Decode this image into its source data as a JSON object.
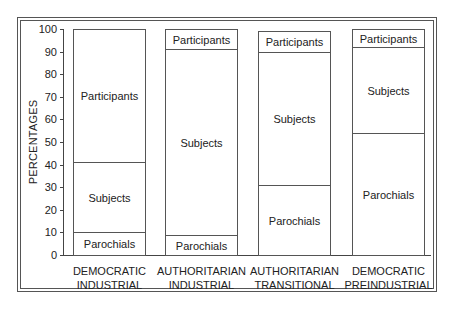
{
  "chart_data": {
    "type": "bar",
    "stacked": true,
    "title": "",
    "xlabel": "",
    "ylabel": "PERCENTAGES",
    "ylim": [
      0,
      100
    ],
    "yticks": [
      0,
      10,
      20,
      30,
      40,
      50,
      60,
      70,
      80,
      90,
      100
    ],
    "categories": [
      [
        "DEMOCRATIC",
        "INDUSTRIAL"
      ],
      [
        "AUTHORITARIAN",
        "INDUSTRIAL"
      ],
      [
        "AUTHORITARIAN",
        "TRANSITIONAL"
      ],
      [
        "DEMOCRATIC",
        "PREINDUSTRIAL"
      ]
    ],
    "series": [
      {
        "name": "Parochials",
        "values": [
          10,
          9,
          31,
          54
        ]
      },
      {
        "name": "Subjects",
        "values": [
          31,
          82,
          59,
          38
        ]
      },
      {
        "name": "Participants",
        "values": [
          59,
          9,
          9,
          8
        ]
      }
    ],
    "bar_tops": [
      100,
      100,
      99,
      100
    ],
    "grid": false,
    "legend": "labels inside segments"
  }
}
